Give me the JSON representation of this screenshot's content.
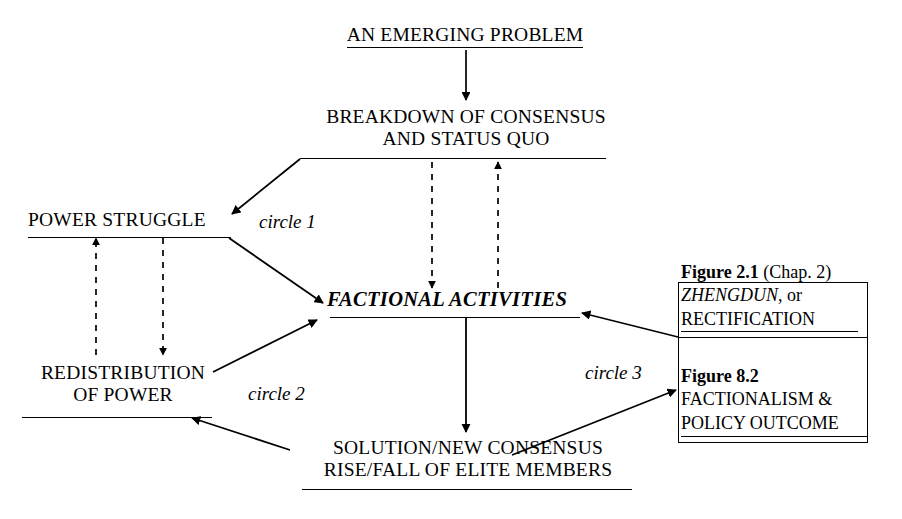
{
  "diagram": {
    "ink_color": "#000000",
    "background": "#ffffff",
    "nodes": {
      "emerging_problem": {
        "label": "AN EMERGING PROBLEM",
        "style": "underlined"
      },
      "breakdown": {
        "line1": "BREAKDOWN OF CONSENSUS",
        "line2": "AND STATUS QUO",
        "style": "underlined"
      },
      "power_struggle": {
        "label": "POWER STRUGGLE",
        "style": "underlined"
      },
      "factional_activities": {
        "label": "FACTIONAL ACTIVITIES",
        "style": "bold-italic-underlined"
      },
      "redistribution": {
        "line1": "REDISTRIBUTION",
        "line2": "OF POWER",
        "style": "underlined"
      },
      "solution": {
        "line1": "SOLUTION/NEW CONSENSUS",
        "line2": "RISE/FALL OF ELITE MEMBERS",
        "style": "underlined"
      }
    },
    "circle_labels": {
      "circle1": "circle 1",
      "circle2": "circle 2",
      "circle3": "circle 3"
    },
    "figure_box": {
      "upper": {
        "caption_bold": "Figure 2.1",
        "caption_rest": " (Chap. 2)",
        "line1_italic": "ZHENGDUN",
        "line1_rest": ", or",
        "line2": "RECTIFICATION"
      },
      "lower": {
        "caption_bold": "Figure 8.2",
        "line1": "FACTIONALISM &",
        "line2": "POLICY OUTCOME"
      }
    },
    "edges": [
      {
        "name": "problem-to-breakdown",
        "from": "emerging_problem",
        "to": "breakdown",
        "style": "solid",
        "direction": "down"
      },
      {
        "name": "breakdown-to-power-struggle",
        "from": "breakdown",
        "to": "power_struggle",
        "style": "solid",
        "direction": "down-left"
      },
      {
        "name": "power-struggle-to-factional",
        "from": "power_struggle",
        "to": "factional_activities",
        "style": "solid",
        "direction": "down-right"
      },
      {
        "name": "breakdown-to-factional-dashed",
        "from": "breakdown",
        "to": "factional_activities",
        "style": "dashed",
        "direction": "down"
      },
      {
        "name": "factional-to-breakdown-dashed",
        "from": "factional_activities",
        "to": "breakdown",
        "style": "dashed",
        "direction": "up"
      },
      {
        "name": "redistribution-to-power-struggle-dashed",
        "from": "redistribution",
        "to": "power_struggle",
        "style": "dashed",
        "direction": "up"
      },
      {
        "name": "power-struggle-to-redistribution-dashed",
        "from": "power_struggle",
        "to": "redistribution",
        "style": "dashed",
        "direction": "down"
      },
      {
        "name": "redistribution-to-factional",
        "from": "redistribution",
        "to": "factional_activities",
        "style": "solid",
        "direction": "up-right"
      },
      {
        "name": "factional-to-solution",
        "from": "factional_activities",
        "to": "solution",
        "style": "solid",
        "direction": "down"
      },
      {
        "name": "solution-to-redistribution",
        "from": "solution",
        "to": "redistribution",
        "style": "solid",
        "direction": "up-left"
      },
      {
        "name": "figure21-to-factional",
        "from": "figure_box_upper",
        "to": "factional_activities",
        "style": "solid",
        "direction": "left"
      },
      {
        "name": "solution-to-figure82",
        "from": "solution",
        "to": "figure_box_lower",
        "style": "solid",
        "direction": "up-right"
      }
    ]
  }
}
